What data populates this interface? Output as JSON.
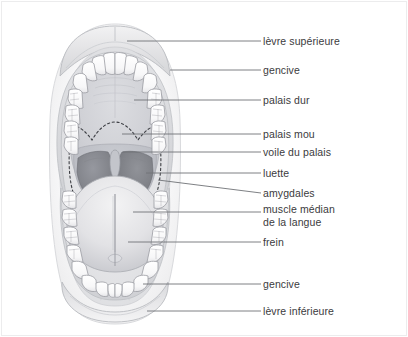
{
  "figure": {
    "illustration_name": "bouche-ouverte-vue-anterieure",
    "line_color": "#6f7276",
    "text_color": "#3b3b3d",
    "border_color": "#ececed",
    "background_color": "#ffffff"
  },
  "labels": [
    {
      "id": "levre-superieure",
      "text": "lèvre supérieure",
      "lines": [
        "lèvre supérieure"
      ],
      "x": 263,
      "y": 35,
      "leader": {
        "x1": 127,
        "y1": 41,
        "x2": 261,
        "y2": 41
      }
    },
    {
      "id": "gencive-superieure",
      "text": "gencive",
      "lines": [
        "gencive"
      ],
      "x": 263,
      "y": 64,
      "leader": {
        "x1": 170,
        "y1": 70,
        "x2": 261,
        "y2": 70
      }
    },
    {
      "id": "palais-dur",
      "text": "palais dur",
      "lines": [
        "palais dur"
      ],
      "x": 263,
      "y": 94,
      "leader": {
        "x1": 134,
        "y1": 100,
        "x2": 261,
        "y2": 100
      }
    },
    {
      "id": "palais-mou",
      "text": "palais mou",
      "lines": [
        "palais mou"
      ],
      "x": 263,
      "y": 128,
      "leader": {
        "x1": 122,
        "y1": 134,
        "x2": 261,
        "y2": 134
      }
    },
    {
      "id": "voile-du-palais",
      "text": "voile du palais",
      "lines": [
        "voile du palais"
      ],
      "x": 263,
      "y": 146,
      "leader": {
        "x1": 123,
        "y1": 152,
        "x2": 261,
        "y2": 152
      }
    },
    {
      "id": "luette",
      "text": "luette",
      "lines": [
        "luette"
      ],
      "x": 263,
      "y": 167,
      "leader": {
        "x1": 146,
        "y1": 173,
        "x2": 261,
        "y2": 173
      }
    },
    {
      "id": "amygdales",
      "text": "amygdales",
      "lines": [
        "amygdales"
      ],
      "x": 263,
      "y": 187,
      "leader": {
        "x1": 158,
        "y1": 180,
        "x2": 261,
        "y2": 193
      }
    },
    {
      "id": "muscle-median-de-la-langue",
      "text": "muscle médian de la langue",
      "lines": [
        "muscle médian",
        "de la langue"
      ],
      "x": 263,
      "y": 203,
      "leader": {
        "x1": 133,
        "y1": 212,
        "x2": 261,
        "y2": 212
      }
    },
    {
      "id": "frein",
      "text": "frein",
      "lines": [
        "frein"
      ],
      "x": 263,
      "y": 236,
      "leader": {
        "x1": 128,
        "y1": 242,
        "x2": 261,
        "y2": 242
      }
    },
    {
      "id": "gencive-inferieure",
      "text": "gencive",
      "lines": [
        "gencive"
      ],
      "x": 263,
      "y": 278,
      "leader": {
        "x1": 143,
        "y1": 284,
        "x2": 261,
        "y2": 284
      }
    },
    {
      "id": "levre-inferieure",
      "text": "lèvre inférieure",
      "lines": [
        "lèvre inférieure"
      ],
      "x": 263,
      "y": 305,
      "leader": {
        "x1": 147,
        "y1": 311,
        "x2": 261,
        "y2": 311
      }
    }
  ],
  "anatomy_parts": [
    {
      "name": "upper-lip",
      "label": "lèvre supérieure"
    },
    {
      "name": "upper-gum",
      "label": "gencive"
    },
    {
      "name": "hard-palate",
      "label": "palais dur"
    },
    {
      "name": "soft-palate",
      "label": "palais mou"
    },
    {
      "name": "velum",
      "label": "voile du palais"
    },
    {
      "name": "uvula",
      "label": "luette"
    },
    {
      "name": "tonsils",
      "label": "amygdales"
    },
    {
      "name": "median-sulcus-tongue",
      "label": "muscle médian de la langue"
    },
    {
      "name": "frenulum",
      "label": "frein"
    },
    {
      "name": "lower-gum",
      "label": "gencive"
    },
    {
      "name": "lower-lip",
      "label": "lèvre inférieure"
    }
  ]
}
